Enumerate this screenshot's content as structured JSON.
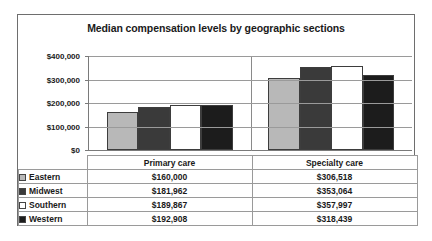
{
  "chart_data": {
    "type": "bar",
    "title": "Median compensation levels by geographic sections",
    "xlabel": "",
    "ylabel": "",
    "ylim": [
      0,
      400000
    ],
    "grid": true,
    "legend_position": "table-left",
    "categories": [
      "Primary care",
      "Specialty care"
    ],
    "ytick_labels": [
      "$400,000",
      "$300,000",
      "$200,000",
      "$100,000",
      "$0"
    ],
    "ytick_values": [
      400000,
      300000,
      200000,
      100000,
      0
    ],
    "series": [
      {
        "name": "Eastern",
        "color": "#b8b8b8",
        "values": [
          160000,
          306518
        ],
        "labels": [
          "$160,000",
          "$306,518"
        ]
      },
      {
        "name": "Midwest",
        "color": "#3a3a3a",
        "values": [
          181962,
          353064
        ],
        "labels": [
          "$181,962",
          "$353,064"
        ]
      },
      {
        "name": "Southern",
        "color": "#ffffff",
        "values": [
          189867,
          357997
        ],
        "labels": [
          "$189,867",
          "$357,997"
        ]
      },
      {
        "name": "Western",
        "color": "#1c1c1c",
        "values": [
          192908,
          318439
        ],
        "labels": [
          "$192,908",
          "$318,439"
        ]
      }
    ]
  },
  "table": {
    "corner_label": "",
    "column_headers": [
      "Primary care",
      "Specialty care"
    ],
    "rows": [
      {
        "label": "Eastern",
        "swatch": "#b8b8b8",
        "values": [
          "$160,000",
          "$306,518"
        ]
      },
      {
        "label": "Midwest",
        "swatch": "#3a3a3a",
        "values": [
          "$181,962",
          "$353,064"
        ]
      },
      {
        "label": "Southern",
        "swatch": "#ffffff",
        "values": [
          "$189,867",
          "$357,997"
        ]
      },
      {
        "label": "Western",
        "swatch": "#1c1c1c",
        "values": [
          "$192,908",
          "$318,439"
        ]
      }
    ]
  }
}
